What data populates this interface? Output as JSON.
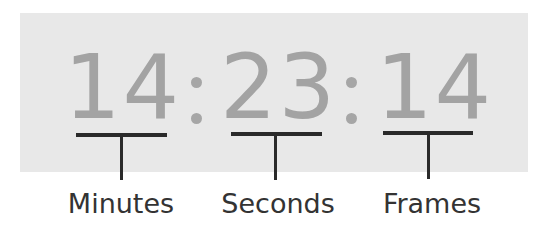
{
  "timecode": {
    "minutes": "14",
    "seconds": "23",
    "frames": "14",
    "separator": ":"
  },
  "labels": {
    "minutes": "Minutes",
    "seconds": "Seconds",
    "frames": "Frames"
  },
  "colors": {
    "panel_background": "#e8e8e8",
    "digit_color": "#a3a3a3",
    "bracket_color": "#2a2a2a",
    "label_color": "#333333"
  }
}
